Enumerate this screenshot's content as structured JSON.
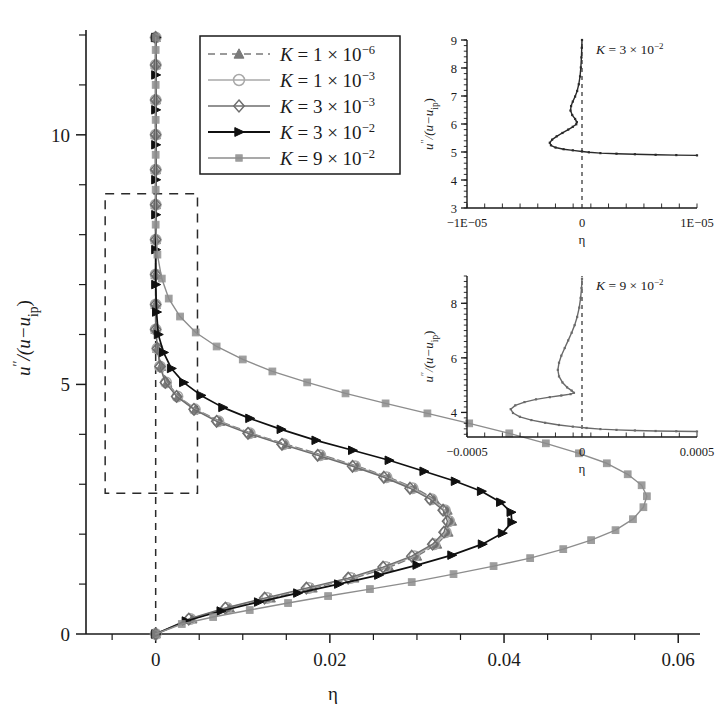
{
  "figure": {
    "width": 717,
    "height": 714,
    "background": "#ffffff"
  },
  "main_axes": {
    "xlabel": "η",
    "ylabel_parts": {
      "num": "u",
      "prime": "′′",
      "denom_open": "/(u−u",
      "sub": "ip",
      "close": ")"
    },
    "ylabel_plain": "u′′/(u−u_ip)",
    "xlim": [
      -0.008,
      0.0625
    ],
    "ylim": [
      0,
      12.1
    ],
    "xticks_major": [
      0,
      0.02,
      0.04,
      0.06
    ],
    "xticklabels": [
      "0",
      "0.02",
      "0.04",
      "0.06"
    ],
    "xticks_minor": [
      -0.005,
      0.005,
      0.01,
      0.015,
      0.025,
      0.03,
      0.035,
      0.045,
      0.05,
      0.055
    ],
    "yticks_major": [
      0,
      5,
      10
    ],
    "yticklabels": [
      "0",
      "5",
      "10"
    ],
    "yticks_minor": [
      1,
      2,
      3,
      4,
      6,
      7,
      8,
      9,
      11,
      12
    ],
    "zero_line_x": 0,
    "zoom_box": {
      "x0": -0.0058,
      "x1": 0.0048,
      "y0": 2.82,
      "y1": 8.82
    }
  },
  "legend": {
    "position": "upper-center-left",
    "entries": [
      {
        "label_k": "K",
        "eq": "= 1 × 10",
        "exp": "−6",
        "marker": "triangle-up",
        "color": "#7a7a7a",
        "dash": "7,5"
      },
      {
        "label_k": "K",
        "eq": "= 1 × 10",
        "exp": "−3",
        "marker": "circle-open",
        "color": "#a8a8a8",
        "dash": ""
      },
      {
        "label_k": "K",
        "eq": "= 3 × 10",
        "exp": "−3",
        "marker": "diamond-open",
        "color": "#6e6e6e",
        "dash": ""
      },
      {
        "label_k": "K",
        "eq": "= 3 × 10",
        "exp": "−2",
        "marker": "triangle-right",
        "color": "#101010",
        "dash": ""
      },
      {
        "label_k": "K",
        "eq": "= 9 × 10",
        "exp": "−2",
        "marker": "square",
        "color": "#8d8d8d",
        "dash": ""
      }
    ]
  },
  "chart_data": {
    "type": "line",
    "title": "",
    "xlabel": "η",
    "ylabel": "u′′/(u−u_ip)",
    "xlim": [
      -0.008,
      0.0625
    ],
    "ylim": [
      0,
      12.1
    ],
    "grid": false,
    "legend_position": "upper-left-center",
    "orientation": "x-is-value, y-is-profile-coordinate",
    "series": [
      {
        "name": "K = 1 × 10^-6",
        "marker": "triangle-up",
        "color": "#7a7a7a",
        "dashed": true,
        "points": [
          [
            0.0,
            0.0
          ],
          [
            0.0042,
            0.3
          ],
          [
            0.0085,
            0.52
          ],
          [
            0.0132,
            0.72
          ],
          [
            0.018,
            0.92
          ],
          [
            0.0228,
            1.12
          ],
          [
            0.0268,
            1.34
          ],
          [
            0.03,
            1.56
          ],
          [
            0.0323,
            1.8
          ],
          [
            0.0336,
            2.04
          ],
          [
            0.034,
            2.26
          ],
          [
            0.0335,
            2.48
          ],
          [
            0.032,
            2.7
          ],
          [
            0.0298,
            2.92
          ],
          [
            0.0268,
            3.14
          ],
          [
            0.0232,
            3.36
          ],
          [
            0.0192,
            3.58
          ],
          [
            0.015,
            3.8
          ],
          [
            0.011,
            4.02
          ],
          [
            0.0074,
            4.26
          ],
          [
            0.0046,
            4.5
          ],
          [
            0.0026,
            4.76
          ],
          [
            0.0013,
            5.04
          ],
          [
            0.0006,
            5.36
          ],
          [
            0.0002,
            5.72
          ],
          [
            0.0,
            6.1
          ],
          [
            0.0,
            6.6
          ],
          [
            0.0,
            7.2
          ],
          [
            0.0,
            7.9
          ],
          [
            0.0,
            8.6
          ],
          [
            0.0,
            9.3
          ],
          [
            0.0,
            10.0
          ],
          [
            0.0,
            10.7
          ],
          [
            0.0,
            11.4
          ],
          [
            0.0,
            11.95
          ]
        ]
      },
      {
        "name": "K = 1 × 10^-3",
        "marker": "circle-open",
        "color": "#a8a8a8",
        "dashed": false,
        "points": [
          [
            0.0,
            0.0
          ],
          [
            0.004,
            0.3
          ],
          [
            0.0082,
            0.52
          ],
          [
            0.0128,
            0.72
          ],
          [
            0.0176,
            0.92
          ],
          [
            0.0224,
            1.12
          ],
          [
            0.0264,
            1.34
          ],
          [
            0.0297,
            1.56
          ],
          [
            0.032,
            1.8
          ],
          [
            0.0333,
            2.04
          ],
          [
            0.0337,
            2.26
          ],
          [
            0.0332,
            2.48
          ],
          [
            0.0317,
            2.7
          ],
          [
            0.0295,
            2.92
          ],
          [
            0.0265,
            3.14
          ],
          [
            0.0229,
            3.36
          ],
          [
            0.0189,
            3.58
          ],
          [
            0.0147,
            3.8
          ],
          [
            0.0108,
            4.02
          ],
          [
            0.0072,
            4.26
          ],
          [
            0.0045,
            4.5
          ],
          [
            0.0025,
            4.76
          ],
          [
            0.0012,
            5.04
          ],
          [
            0.0005,
            5.36
          ],
          [
            0.0002,
            5.72
          ],
          [
            0.0,
            6.1
          ],
          [
            0.0,
            6.6
          ],
          [
            0.0,
            7.2
          ],
          [
            0.0,
            7.9
          ],
          [
            0.0,
            8.6
          ],
          [
            0.0,
            9.3
          ],
          [
            0.0,
            10.0
          ],
          [
            0.0,
            10.7
          ],
          [
            0.0,
            11.4
          ],
          [
            0.0,
            11.95
          ]
        ]
      },
      {
        "name": "K = 3 × 10^-3",
        "marker": "diamond-open",
        "color": "#6e6e6e",
        "dashed": false,
        "points": [
          [
            0.0,
            0.0
          ],
          [
            0.0038,
            0.3
          ],
          [
            0.008,
            0.52
          ],
          [
            0.0125,
            0.72
          ],
          [
            0.0173,
            0.92
          ],
          [
            0.0221,
            1.12
          ],
          [
            0.0261,
            1.34
          ],
          [
            0.0294,
            1.56
          ],
          [
            0.0318,
            1.8
          ],
          [
            0.0331,
            2.04
          ],
          [
            0.0335,
            2.26
          ],
          [
            0.033,
            2.48
          ],
          [
            0.0315,
            2.7
          ],
          [
            0.0292,
            2.92
          ],
          [
            0.0262,
            3.14
          ],
          [
            0.0226,
            3.36
          ],
          [
            0.0186,
            3.58
          ],
          [
            0.0145,
            3.8
          ],
          [
            0.0106,
            4.02
          ],
          [
            0.007,
            4.26
          ],
          [
            0.0044,
            4.5
          ],
          [
            0.0024,
            4.76
          ],
          [
            0.0011,
            5.04
          ],
          [
            0.0005,
            5.36
          ],
          [
            0.0002,
            5.72
          ],
          [
            0.0,
            6.1
          ],
          [
            0.0,
            6.6
          ],
          [
            0.0,
            7.2
          ],
          [
            0.0,
            7.9
          ],
          [
            0.0,
            8.6
          ],
          [
            0.0,
            9.3
          ],
          [
            0.0,
            10.0
          ],
          [
            0.0,
            10.7
          ],
          [
            0.0,
            11.4
          ],
          [
            0.0,
            11.95
          ]
        ]
      },
      {
        "name": "K = 3 × 10^-2",
        "marker": "triangle-right",
        "color": "#101010",
        "dashed": false,
        "points": [
          [
            0.0,
            0.0
          ],
          [
            0.0035,
            0.26
          ],
          [
            0.0075,
            0.46
          ],
          [
            0.0118,
            0.64
          ],
          [
            0.0163,
            0.82
          ],
          [
            0.021,
            1.0
          ],
          [
            0.0256,
            1.18
          ],
          [
            0.03,
            1.38
          ],
          [
            0.034,
            1.58
          ],
          [
            0.0375,
            1.8
          ],
          [
            0.0398,
            2.02
          ],
          [
            0.0409,
            2.24
          ],
          [
            0.0408,
            2.44
          ],
          [
            0.0396,
            2.64
          ],
          [
            0.0374,
            2.86
          ],
          [
            0.0344,
            3.06
          ],
          [
            0.0308,
            3.26
          ],
          [
            0.0268,
            3.48
          ],
          [
            0.0226,
            3.68
          ],
          [
            0.0184,
            3.88
          ],
          [
            0.0144,
            4.1
          ],
          [
            0.0108,
            4.32
          ],
          [
            0.0077,
            4.54
          ],
          [
            0.0052,
            4.78
          ],
          [
            0.0032,
            5.04
          ],
          [
            0.0018,
            5.32
          ],
          [
            0.0009,
            5.64
          ],
          [
            0.0003,
            6.0
          ],
          [
            0.0001,
            6.45
          ],
          [
            0.0,
            7.0
          ],
          [
            0.0,
            7.7
          ],
          [
            0.0,
            8.4
          ],
          [
            0.0,
            9.1
          ],
          [
            0.0,
            9.8
          ],
          [
            0.0,
            10.5
          ],
          [
            0.0,
            11.2
          ],
          [
            0.0,
            11.95
          ]
        ]
      },
      {
        "name": "K = 9 × 10^-2",
        "marker": "square",
        "color": "#8d8d8d",
        "dashed": false,
        "points": [
          [
            0.0,
            0.0
          ],
          [
            0.003,
            0.2
          ],
          [
            0.0066,
            0.34
          ],
          [
            0.0108,
            0.48
          ],
          [
            0.0152,
            0.62
          ],
          [
            0.0198,
            0.76
          ],
          [
            0.0246,
            0.9
          ],
          [
            0.0294,
            1.04
          ],
          [
            0.0342,
            1.2
          ],
          [
            0.0388,
            1.36
          ],
          [
            0.043,
            1.52
          ],
          [
            0.0468,
            1.7
          ],
          [
            0.05,
            1.88
          ],
          [
            0.0528,
            2.08
          ],
          [
            0.0548,
            2.3
          ],
          [
            0.056,
            2.54
          ],
          [
            0.0564,
            2.76
          ],
          [
            0.0558,
            2.98
          ],
          [
            0.0542,
            3.2
          ],
          [
            0.0518,
            3.42
          ],
          [
            0.0486,
            3.62
          ],
          [
            0.0448,
            3.82
          ],
          [
            0.0406,
            4.02
          ],
          [
            0.036,
            4.22
          ],
          [
            0.0312,
            4.42
          ],
          [
            0.0264,
            4.62
          ],
          [
            0.0218,
            4.82
          ],
          [
            0.0174,
            5.04
          ],
          [
            0.0134,
            5.26
          ],
          [
            0.01,
            5.5
          ],
          [
            0.007,
            5.76
          ],
          [
            0.0046,
            6.04
          ],
          [
            0.0028,
            6.36
          ],
          [
            0.0015,
            6.72
          ],
          [
            0.0007,
            7.12
          ],
          [
            0.0002,
            7.6
          ],
          [
            0.0,
            8.2
          ],
          [
            0.0,
            8.9
          ],
          [
            0.0,
            9.6
          ],
          [
            0.0,
            10.3
          ],
          [
            0.0,
            11.0
          ],
          [
            0.0,
            11.7
          ],
          [
            0.0,
            11.95
          ]
        ]
      }
    ]
  },
  "inset1": {
    "title_k": "K",
    "title_eq": "= 3 × 10",
    "title_exp": "−2",
    "title_plain": "K = 3 × 10^-2",
    "xlabel": "η",
    "ylabel_plain": "u′′/(u−u_ip)",
    "xlim": [
      -1e-05,
      1e-05
    ],
    "ylim": [
      3,
      9
    ],
    "xticklabels": [
      "−1E−05",
      "0",
      "1E−05"
    ],
    "yticks": [
      3,
      4,
      5,
      6,
      7,
      8,
      9
    ],
    "yticklabels": [
      "3",
      "4",
      "5",
      "6",
      "7",
      "8",
      "9"
    ],
    "chart_data": {
      "type": "line",
      "series_name": "K = 3 × 10^-2",
      "color": "#2a2a2a",
      "points": [
        [
          1e-05,
          4.88
        ],
        [
          8.2e-06,
          4.89
        ],
        [
          6.4e-06,
          4.9
        ],
        [
          4.6e-06,
          4.92
        ],
        [
          3e-06,
          4.94
        ],
        [
          1.6e-06,
          4.96
        ],
        [
          6e-07,
          4.99
        ],
        [
          0.0,
          5.02
        ],
        [
          -8e-07,
          5.06
        ],
        [
          -1.6e-06,
          5.1
        ],
        [
          -2.3e-06,
          5.16
        ],
        [
          -2.7e-06,
          5.24
        ],
        [
          -2.8e-06,
          5.33
        ],
        [
          -2.6e-06,
          5.44
        ],
        [
          -2.2e-06,
          5.56
        ],
        [
          -1.7e-06,
          5.68
        ],
        [
          -1.2e-06,
          5.8
        ],
        [
          -8e-07,
          5.9
        ],
        [
          -5e-07,
          5.99
        ],
        [
          -4.5e-07,
          6.07
        ],
        [
          -6e-07,
          6.18
        ],
        [
          -8.5e-07,
          6.32
        ],
        [
          -1e-06,
          6.48
        ],
        [
          -9.5e-07,
          6.64
        ],
        [
          -8e-07,
          6.8
        ],
        [
          -6e-07,
          6.98
        ],
        [
          -4.2e-07,
          7.18
        ],
        [
          -2.8e-07,
          7.42
        ],
        [
          -1.7e-07,
          7.7
        ],
        [
          -1e-07,
          8.02
        ],
        [
          -5e-08,
          8.38
        ],
        [
          -2e-08,
          8.72
        ],
        [
          0.0,
          9.0
        ]
      ]
    }
  },
  "inset2": {
    "title_k": "K",
    "title_eq": "= 9 × 10",
    "title_exp": "−2",
    "title_plain": "K = 9 × 10^-2",
    "xlabel": "η",
    "ylabel_plain": "u′′/(u−u_ip)",
    "xlim": [
      -0.0005,
      0.0005
    ],
    "ylim": [
      3.1,
      9.0
    ],
    "xticklabels": [
      "−0.0005",
      "0",
      "0.0005"
    ],
    "yticks": [
      4,
      6,
      8
    ],
    "yticklabels": [
      "4",
      "6",
      "8"
    ],
    "chart_data": {
      "type": "line",
      "series_name": "K = 9 × 10^-2",
      "color": "#6a6a6a",
      "points": [
        [
          0.0005,
          3.3
        ],
        [
          0.00041,
          3.31
        ],
        [
          0.00032,
          3.32
        ],
        [
          0.00023,
          3.34
        ],
        [
          0.00015,
          3.36
        ],
        [
          8e-05,
          3.39
        ],
        [
          2e-05,
          3.43
        ],
        [
          -4e-05,
          3.48
        ],
        [
          -0.0001,
          3.54
        ],
        [
          -0.00016,
          3.62
        ],
        [
          -0.00022,
          3.72
        ],
        [
          -0.00027,
          3.84
        ],
        [
          -0.0003,
          3.98
        ],
        [
          -0.00031,
          4.12
        ],
        [
          -0.00029,
          4.26
        ],
        [
          -0.00025,
          4.38
        ],
        [
          -0.0002,
          4.48
        ],
        [
          -0.00014,
          4.56
        ],
        [
          -9e-05,
          4.62
        ],
        [
          -5e-05,
          4.67
        ],
        [
          -3.5e-05,
          4.72
        ],
        [
          -4.5e-05,
          4.8
        ],
        [
          -6.5e-05,
          4.92
        ],
        [
          -8.5e-05,
          5.1
        ],
        [
          -0.0001,
          5.32
        ],
        [
          -0.000105,
          5.56
        ],
        [
          -0.0001,
          5.82
        ],
        [
          -9e-05,
          6.08
        ],
        [
          -7.5e-05,
          6.36
        ],
        [
          -6e-05,
          6.64
        ],
        [
          -4.5e-05,
          6.92
        ],
        [
          -3.2e-05,
          7.2
        ],
        [
          -2.1e-05,
          7.5
        ],
        [
          -1.2e-05,
          7.84
        ],
        [
          -6e-06,
          8.2
        ],
        [
          -2e-06,
          8.56
        ],
        [
          0.0,
          8.9
        ]
      ]
    }
  }
}
